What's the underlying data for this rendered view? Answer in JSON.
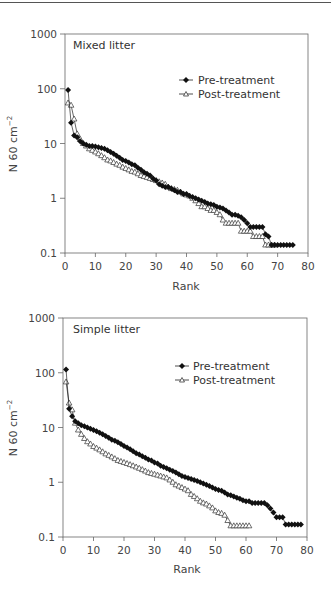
{
  "chart_data": [
    {
      "type": "line",
      "title": "Mixed litter",
      "xlabel": "Rank",
      "ylabel": "N 60 cm⁻²",
      "yscale": "log",
      "xlim": [
        0,
        80
      ],
      "ylim": [
        0.1,
        1000
      ],
      "xticks": [
        "0",
        "10",
        "20",
        "30",
        "40",
        "50",
        "60",
        "70",
        "80"
      ],
      "yticks": [
        "0.1",
        "1",
        "10",
        "100",
        "1000"
      ],
      "grid": false,
      "legend_position": "upper right",
      "series": [
        {
          "name": "Pre-treatment",
          "marker": "filled-diamond",
          "values": [
            95,
            24,
            14,
            13,
            11,
            10,
            9.5,
            9,
            9,
            8.8,
            8.5,
            8.3,
            8,
            7.5,
            7,
            6.5,
            6,
            5.5,
            5,
            4.8,
            4.5,
            4.2,
            4,
            3.6,
            3.3,
            3,
            2.8,
            2.6,
            2.3,
            2.1,
            1.8,
            1.7,
            1.6,
            1.6,
            1.5,
            1.4,
            1.3,
            1.3,
            1.2,
            1.2,
            1.1,
            1.05,
            1.0,
            0.95,
            0.9,
            0.85,
            0.8,
            0.78,
            0.75,
            0.7,
            0.68,
            0.65,
            0.6,
            0.55,
            0.5,
            0.5,
            0.48,
            0.45,
            0.4,
            0.35,
            0.3,
            0.3,
            0.3,
            0.3,
            0.3,
            0.22,
            0.2,
            0.14,
            0.14,
            0.14,
            0.14,
            0.14,
            0.14,
            0.14,
            0.14
          ]
        },
        {
          "name": "Post-treatment",
          "marker": "open-triangle",
          "values": [
            55,
            50,
            28,
            15,
            12,
            10,
            9,
            8,
            7.5,
            7,
            6.5,
            6,
            5.5,
            5,
            4.8,
            4.5,
            4.2,
            4,
            3.7,
            3.5,
            3.3,
            3.1,
            3,
            2.8,
            2.6,
            2.5,
            2.4,
            2.3,
            2.2,
            2.1,
            2.0,
            1.9,
            1.8,
            1.6,
            1.5,
            1.45,
            1.4,
            1.3,
            1.2,
            1.15,
            1.1,
            1.0,
            0.9,
            0.8,
            0.7,
            0.7,
            0.65,
            0.6,
            0.6,
            0.55,
            0.5,
            0.4,
            0.35,
            0.35,
            0.35,
            0.35,
            0.35,
            0.25,
            0.25,
            0.25,
            0.25,
            0.2,
            0.2,
            0.2,
            0.2,
            0.14,
            0.14,
            0.14,
            0.14
          ]
        }
      ]
    },
    {
      "type": "line",
      "title": "Simple litter",
      "xlabel": "Rank",
      "ylabel": "N 60 cm⁻²",
      "yscale": "log",
      "xlim": [
        0,
        80
      ],
      "ylim": [
        0.1,
        1000
      ],
      "xticks": [
        "0",
        "10",
        "20",
        "30",
        "40",
        "50",
        "60",
        "70",
        "80"
      ],
      "yticks": [
        "0.1",
        "1",
        "10",
        "100",
        "1000"
      ],
      "grid": false,
      "legend_position": "upper right",
      "series": [
        {
          "name": "Pre-treatment",
          "marker": "filled-diamond",
          "values": [
            115,
            22,
            16,
            13,
            12,
            11,
            10.5,
            10,
            9.5,
            9,
            8.5,
            8,
            7.5,
            7,
            6.5,
            6,
            5.7,
            5.4,
            5,
            4.6,
            4.3,
            4,
            3.7,
            3.4,
            3.2,
            3,
            2.8,
            2.6,
            2.5,
            2.3,
            2.2,
            2.0,
            1.9,
            1.8,
            1.7,
            1.6,
            1.5,
            1.4,
            1.3,
            1.25,
            1.2,
            1.15,
            1.1,
            1.05,
            1.0,
            0.95,
            0.9,
            0.85,
            0.8,
            0.75,
            0.72,
            0.7,
            0.65,
            0.6,
            0.58,
            0.55,
            0.52,
            0.5,
            0.47,
            0.45,
            0.45,
            0.42,
            0.42,
            0.42,
            0.42,
            0.42,
            0.38,
            0.33,
            0.28,
            0.23,
            0.23,
            0.23,
            0.17,
            0.17,
            0.17,
            0.17,
            0.17,
            0.17
          ]
        },
        {
          "name": "Post-treatment",
          "marker": "open-triangle",
          "values": [
            68,
            28,
            21,
            12,
            9,
            7.5,
            6.3,
            5.5,
            5,
            4.5,
            4.2,
            3.9,
            3.6,
            3.3,
            3.1,
            2.9,
            2.7,
            2.5,
            2.4,
            2.3,
            2.2,
            2.1,
            2.0,
            1.9,
            1.8,
            1.7,
            1.6,
            1.5,
            1.45,
            1.4,
            1.35,
            1.3,
            1.25,
            1.2,
            1.1,
            1.0,
            0.9,
            0.85,
            0.8,
            0.75,
            0.7,
            0.6,
            0.55,
            0.5,
            0.45,
            0.42,
            0.4,
            0.37,
            0.34,
            0.3,
            0.28,
            0.27,
            0.25,
            0.2,
            0.16,
            0.16,
            0.16,
            0.16,
            0.16,
            0.16,
            0.16
          ]
        }
      ]
    }
  ],
  "panels": [
    {
      "title": "Mixed litter",
      "xlabel": "Rank",
      "ylabel_main": "N 60 cm",
      "ylabel_sup": "−2",
      "legend": [
        {
          "label": "Pre-treatment"
        },
        {
          "label": "Post-treatment"
        }
      ],
      "xticks": [
        "0",
        "10",
        "20",
        "30",
        "40",
        "50",
        "60",
        "70",
        "80"
      ],
      "yticks": [
        "1000",
        "100",
        "10",
        "1",
        "0.1"
      ]
    },
    {
      "title": "Simple litter",
      "xlabel": "Rank",
      "ylabel_main": "N 60 cm",
      "ylabel_sup": "−2",
      "legend": [
        {
          "label": "Pre-treatment"
        },
        {
          "label": "Post-treatment"
        }
      ],
      "xticks": [
        "0",
        "10",
        "20",
        "30",
        "40",
        "50",
        "60",
        "70",
        "80"
      ],
      "yticks": [
        "1000",
        "100",
        "10",
        "1",
        "0.1"
      ]
    }
  ],
  "colors": {
    "axis": "#555555",
    "pre_marker": "#111111",
    "post_marker": "#333333",
    "text": "#444444"
  }
}
